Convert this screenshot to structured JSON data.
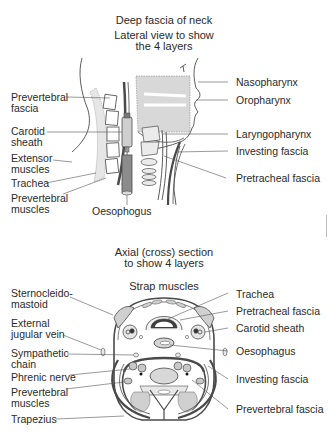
{
  "lateral": {
    "title": "Deep fascia of neck",
    "subtitle_line1": "Lateral view to show",
    "subtitle_line2": "the 4 layers",
    "labels_left": {
      "prevertebral_fascia_1": "Prevertebral",
      "prevertebral_fascia_2": "fascia",
      "carotid_sheath_1": "Carotid",
      "carotid_sheath_2": "sheath",
      "extensor_muscles_1": "Extensor",
      "extensor_muscles_2": "muscles",
      "trachea": "Trachea",
      "prevertebral_muscles_1": "Prevertebral",
      "prevertebral_muscles_2": "muscles"
    },
    "labels_bottom": {
      "oesophagus": "Oesophogus"
    },
    "labels_right": {
      "nasopharynx": "Nasopharynx",
      "oropharynx": "Oropharynx",
      "laryngopharynx": "Laryngopharynx",
      "investing_fascia": "Investing fascia",
      "pretracheal_fascia": "Pretracheal fascia"
    }
  },
  "axial": {
    "title_line1": "Axial (cross) section",
    "title_line2": "to show 4 layers",
    "top_label": "Strap muscles",
    "labels_left": {
      "sternocleidomastoid_1": "Sternocleido-",
      "sternocleidomastoid_2": "mastoid",
      "external_jugular_1": "External",
      "external_jugular_2": "jugular vein",
      "sympathetic_chain_1": "Sympathetic",
      "sympathetic_chain_2": "chain",
      "phrenic_nerve": "Phrenic nerve",
      "prevertebral_muscles_1": "Prevertebral",
      "prevertebral_muscles_2": "muscles",
      "trapezius": "Trapezius"
    },
    "labels_right": {
      "trachea": "Trachea",
      "pretracheal_fascia": "Pretracheal fascia",
      "carotid_sheath": "Carotid sheath",
      "oesophagus": "Oesophagus",
      "investing_fascia": "Investing fascia",
      "prevertebral_fascia": "Prevertebral fascia"
    }
  },
  "colors": {
    "line": "#4a4a4a",
    "fill_gray": "#d6d6d6",
    "fill_dark": "#8a8a8a",
    "fill_light": "#ececec"
  }
}
